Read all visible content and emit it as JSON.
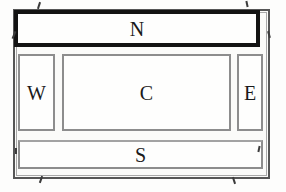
{
  "figure": {
    "type": "border-layout-window",
    "buttons": {
      "north": {
        "label": "N"
      },
      "west": {
        "label": "W"
      },
      "center": {
        "label": "C"
      },
      "east": {
        "label": "E"
      },
      "south": {
        "label": "S"
      }
    },
    "colors": {
      "north_button_border": "#131313",
      "button_border": "#8d8d8d",
      "window_frame_border": "#565656",
      "window_frame_inner_line": "#a9a9a9",
      "text": "#1a1a1a",
      "button_background": "#fefefd",
      "page_background": "#ffffff"
    }
  }
}
